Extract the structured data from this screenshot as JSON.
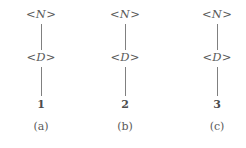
{
  "figure": {
    "background_color": "#ffffff",
    "text_color": "#5a5a5a",
    "edge_color": "#808080"
  },
  "trees": [
    {
      "root_open": "<",
      "root_symbol": "N",
      "root_close": ">",
      "child_open": "<",
      "child_symbol": "D",
      "child_close": ">",
      "leaf": "1",
      "caption": "(a)"
    },
    {
      "root_open": "<",
      "root_symbol": "N",
      "root_close": ">",
      "child_open": "<",
      "child_symbol": "D",
      "child_close": ">",
      "leaf": "2",
      "caption": "(b)"
    },
    {
      "root_open": "<",
      "root_symbol": "N",
      "root_close": ">",
      "child_open": "<",
      "child_symbol": "D",
      "child_close": ">",
      "leaf": "3",
      "caption": "(c)"
    }
  ]
}
